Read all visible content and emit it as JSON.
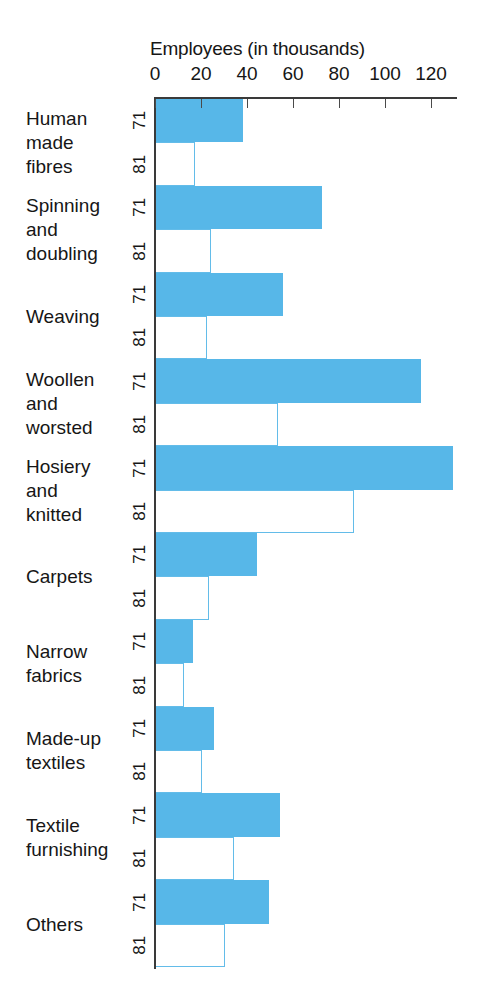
{
  "chart_data": {
    "type": "bar",
    "orientation": "horizontal",
    "title": "Employees (in thousands)",
    "xlabel": "Employees (in thousands)",
    "ylabel": "",
    "xlim": [
      0,
      130
    ],
    "xticks": [
      0,
      20,
      40,
      60,
      80,
      100,
      120
    ],
    "xtick_labels": [
      "0",
      "20",
      "40",
      "60",
      "80",
      "100",
      "120"
    ],
    "grid": false,
    "legend": null,
    "group_labels": [
      "71",
      "81"
    ],
    "categories": [
      "Human\nmade\nfibres",
      "Spinning\nand\ndoubling",
      "Weaving",
      "Woollen\nand\nworsted",
      "Hosiery\nand\nknitted",
      "Carpets",
      "Narrow\nfabrics",
      "Made-up\ntextiles",
      "Textile\nfurnishing",
      "Others"
    ],
    "series": [
      {
        "name": "71",
        "style": "filled",
        "values": [
          38,
          72,
          55,
          115,
          129,
          44,
          16,
          25,
          54,
          49
        ]
      },
      {
        "name": "81",
        "style": "outlined",
        "values": [
          17,
          24,
          22,
          53,
          86,
          23,
          12,
          20,
          34,
          30
        ]
      }
    ],
    "colors": {
      "fill": "#57b7e8",
      "outline": "#63bce9",
      "axis": "#3a3a3a",
      "text": "#161616",
      "background": "#ffffff"
    }
  }
}
